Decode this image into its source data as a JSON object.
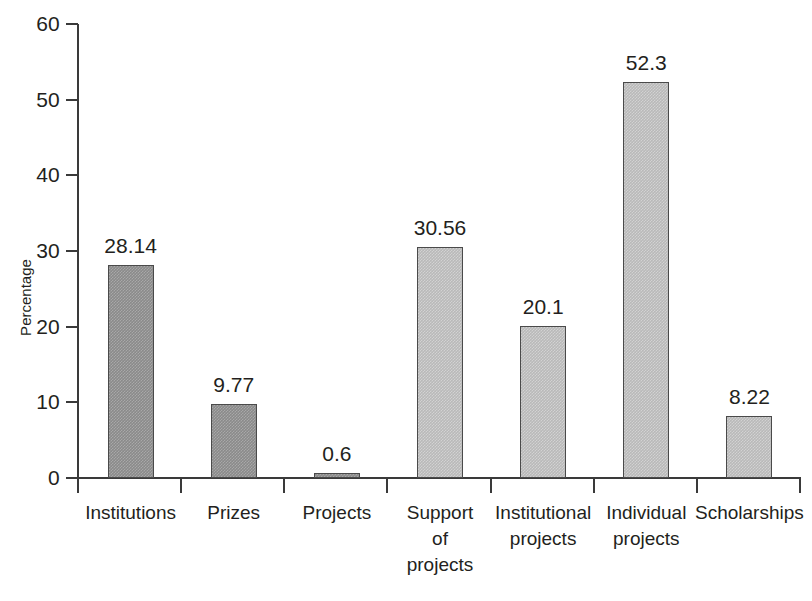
{
  "chart_data": {
    "type": "bar",
    "title": "",
    "xlabel": "",
    "ylabel": "Percentage",
    "categories": [
      "Institutions",
      "Prizes",
      "Projects",
      "Support of projects",
      "Institutional projects",
      "Individual projects",
      "Scholarships"
    ],
    "category_lines": [
      [
        "Institutions"
      ],
      [
        "Prizes"
      ],
      [
        "Projects"
      ],
      [
        "Support",
        "of",
        "projects"
      ],
      [
        "Institutional",
        "projects"
      ],
      [
        "Individual",
        "projects"
      ],
      [
        "Scholarships"
      ]
    ],
    "values": [
      28.14,
      9.77,
      0.6,
      30.56,
      20.1,
      52.3,
      8.22
    ],
    "value_labels": [
      "28.14",
      "9.77",
      "0.6",
      "30.56",
      "20.1",
      "52.3",
      "8.22"
    ],
    "bar_shades": [
      "dark",
      "dark",
      "dark",
      "light",
      "light",
      "light",
      "light"
    ],
    "ylim": [
      0,
      60
    ],
    "yticks": [
      0,
      10,
      20,
      30,
      40,
      50,
      60
    ],
    "ytick_labels": [
      "0",
      "10",
      "20",
      "30",
      "40",
      "50",
      "60"
    ],
    "grid": false,
    "legend": false
  },
  "colors": {
    "bar_dark": "#8a8a8a",
    "bar_light": "#b9b9b9",
    "bar_border": "#4a4a4a",
    "axis": "#3a3a3a",
    "text": "#231f20",
    "background": "#ffffff"
  }
}
